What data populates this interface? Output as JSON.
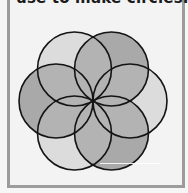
{
  "caption": "use to make circles.",
  "diagram": {
    "center": [
      93,
      101
    ],
    "radius": 37,
    "circles": [
      {
        "position": "top-left",
        "fill": "#dcdcdc"
      },
      {
        "position": "top-right",
        "fill": "#a9a9a9"
      },
      {
        "position": "right",
        "fill": "#dcdcdc"
      },
      {
        "position": "bottom-right",
        "fill": "#a9a9a9"
      },
      {
        "position": "bottom-left",
        "fill": "#dcdcdc"
      },
      {
        "position": "left",
        "fill": "#a9a9a9"
      }
    ],
    "petal_fill": "#b3b3b3",
    "stroke": "#141414"
  },
  "colors": {
    "background": "#f3f3f3",
    "frame_border": "#9c9c9c"
  }
}
